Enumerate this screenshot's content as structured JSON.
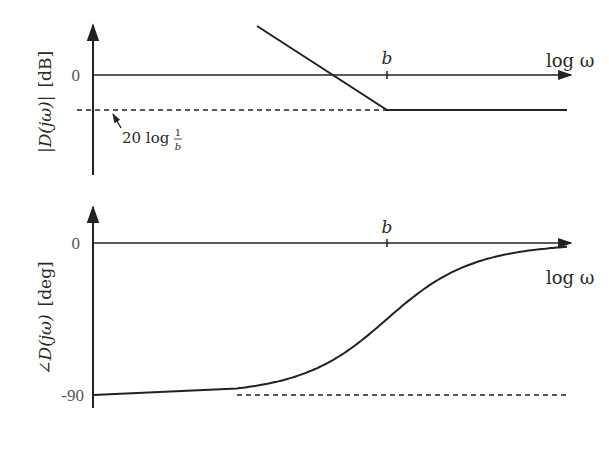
{
  "chart_data": [
    {
      "type": "line",
      "title": "Bode magnitude of lead/lag compensator (asymptotic)",
      "ylabel": "|D(jω)| [dB]",
      "xlabel": "log ω",
      "x_ticks": [
        {
          "label": "b",
          "value": 0
        }
      ],
      "y_ticks": [
        {
          "label": "0",
          "value": 0
        }
      ],
      "x_units": "decades relative to b",
      "xlim": [
        -3.1,
        1.8
      ],
      "ylim": [
        -2.8,
        1.5
      ],
      "series": [
        {
          "name": "magnitude asymptote",
          "style": "solid",
          "points": [
            [
              -1.3,
              1.4
            ],
            [
              0,
              -1
            ],
            [
              1.8,
              -1
            ]
          ]
        },
        {
          "name": "20 log 1/b reference",
          "style": "dashed",
          "points": [
            [
              -3.1,
              -1
            ],
            [
              0,
              -1
            ]
          ]
        }
      ],
      "annotations": [
        {
          "text": "20 log 1/b",
          "points_to": "dashed reference level"
        }
      ]
    },
    {
      "type": "line",
      "ylabel": "∠D(jω) [deg]",
      "xlabel": "log ω",
      "x_ticks": [
        {
          "label": "b",
          "value": 0
        }
      ],
      "y_ticks": [
        {
          "label": "0",
          "value": 0
        },
        {
          "label": "-90",
          "value": -90
        }
      ],
      "xlim": [
        -3.1,
        1.8
      ],
      "ylim": [
        -100,
        20
      ],
      "series": [
        {
          "name": "phase",
          "style": "solid",
          "description": "phase = -90 + atan(ω/b) in degrees, rising from -90 to 0, centered at b",
          "points": [
            [
              -3.1,
              -90
            ],
            [
              -1.5,
              -88
            ],
            [
              -1,
              -84
            ],
            [
              -0.5,
              -72
            ],
            [
              0,
              -45
            ],
            [
              0.5,
              -18
            ],
            [
              1,
              -6
            ],
            [
              1.5,
              -2
            ],
            [
              1.8,
              -1
            ]
          ]
        },
        {
          "name": "-90 reference",
          "style": "dashed",
          "points": [
            [
              -1.5,
              -90
            ],
            [
              1.8,
              -90
            ]
          ]
        }
      ]
    }
  ],
  "labels": {
    "top_ylabel_main": "|D(jω)|",
    "top_ylabel_unit": "[dB]",
    "bottom_ylabel_main": "∠D(jω)",
    "bottom_ylabel_unit": "[deg]",
    "xlabel": "log ω",
    "b_tick": "b",
    "zero": "0",
    "minus90": "-90",
    "annot_prefix": "20 log ",
    "annot_num": "1",
    "annot_den": "b"
  }
}
